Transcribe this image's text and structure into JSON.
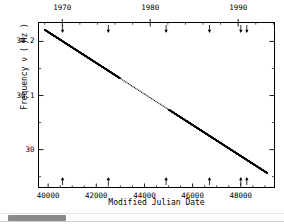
{
  "figure": {
    "xlabel": "Modified Julian Date",
    "ylabel": "Frequency ν ( Hz )"
  },
  "scrollbar": {
    "name": "horizontal-scrollbar",
    "thumb_fraction": 0.21
  },
  "chart_data": {
    "type": "line",
    "title": "",
    "xlabel": "Modified Julian Date",
    "ylabel": "Frequency ν ( Hz )",
    "xlim": [
      39600,
      49400
    ],
    "ylim": [
      29.93,
      30.235
    ],
    "xticks": [
      40000,
      42000,
      44000,
      46000,
      48000
    ],
    "xticklabels": [
      "40000",
      "42000",
      "44000",
      "46000",
      "48000"
    ],
    "yticks": [
      30.0,
      30.1,
      30.2
    ],
    "yticklabels": [
      "30",
      "30.1",
      "30.2"
    ],
    "grid": false,
    "legend": null,
    "top_axis": {
      "label": "",
      "ticks": [
        1970,
        1980,
        1990
      ],
      "ticklabels": [
        "1970",
        "1980",
        "1990"
      ]
    },
    "series": [
      {
        "name": "Pulsar spin frequency",
        "marker": "dot",
        "x": [
          39860,
          39980,
          40100,
          40220,
          40340,
          40460,
          40580,
          40700,
          40820,
          40940,
          41060,
          41180,
          41300,
          41420,
          41540,
          41660,
          41780,
          41900,
          42020,
          42140,
          42260,
          42380,
          42500,
          42620,
          42740,
          42860,
          42980,
          43100,
          43220,
          43340,
          43460,
          43580,
          43700,
          43820,
          43940,
          44060,
          44180,
          44300,
          44420,
          44540,
          44660,
          44780,
          44900,
          45020,
          45140,
          45260,
          45380,
          45500,
          45620,
          45740,
          45860,
          45980,
          46100,
          46220,
          46340,
          46460,
          46580,
          46700,
          46820,
          46940,
          47060,
          47180,
          47300,
          47420,
          47540,
          47660,
          47780,
          47900,
          48020,
          48140,
          48260,
          48380,
          48500,
          48620,
          48740,
          48860,
          48980,
          49100
        ],
        "y": [
          30.2215,
          30.2181,
          30.2146,
          30.2112,
          30.2078,
          30.2043,
          30.2009,
          30.1974,
          30.194,
          30.1906,
          30.1871,
          30.1837,
          30.1802,
          30.1768,
          30.1734,
          30.1699,
          30.1665,
          30.163,
          30.1596,
          30.1562,
          30.1527,
          30.1493,
          30.1458,
          30.1424,
          30.139,
          30.1355,
          30.1321,
          30.1286,
          30.1252,
          30.1218,
          30.1183,
          30.1149,
          30.1114,
          30.108,
          30.1046,
          30.1011,
          30.0977,
          30.0942,
          30.0908,
          30.0874,
          30.0839,
          30.0805,
          30.077,
          30.0736,
          30.0702,
          30.0667,
          30.0633,
          30.0598,
          30.0564,
          30.053,
          30.0495,
          30.0461,
          30.0426,
          30.0392,
          30.0358,
          30.0323,
          30.0289,
          30.0254,
          30.022,
          30.0186,
          30.0151,
          30.0117,
          30.0082,
          30.0048,
          30.0014,
          29.9979,
          29.9945,
          29.991,
          29.9876,
          29.9842,
          29.9807,
          29.9773,
          29.9738,
          29.9704,
          29.967,
          29.9635,
          29.9601,
          29.9566
        ],
        "sparse_region": {
          "x_start": 42900,
          "x_end": 44900,
          "description": "sparse sampling gap"
        }
      }
    ],
    "annotations": {
      "glitch_arrows_bottom": {
        "direction": "up",
        "x": [
          40600,
          42500,
          44900,
          46700,
          48000,
          48250
        ],
        "label": "glitch epochs"
      },
      "glitch_arrows_top": {
        "direction": "down",
        "x": [
          40600,
          42500,
          44900,
          46700,
          48000,
          48250
        ],
        "label": "glitch epochs"
      }
    }
  }
}
